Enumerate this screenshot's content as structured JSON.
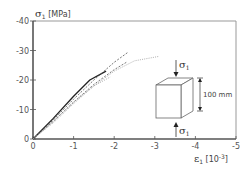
{
  "chart_data": {
    "type": "line",
    "title": "",
    "xlabel": "ε1 [10-3]",
    "ylabel": "σ1 [MPa]",
    "xlim": [
      0,
      -5
    ],
    "ylim": [
      0,
      -40
    ],
    "grid": false,
    "x_ticks": [
      "0",
      "-1",
      "-2",
      "-3",
      "-4",
      "-5"
    ],
    "y_ticks": [
      "0",
      "-10",
      "-20",
      "-30",
      "-40"
    ],
    "series": [
      {
        "name": "solid",
        "style": "solid",
        "x": [
          0,
          -0.5,
          -1.0,
          -1.4,
          -1.8
        ],
        "y": [
          0,
          -7,
          -14.5,
          -20,
          -23
        ]
      },
      {
        "name": "dashed-1",
        "style": "dashed",
        "x": [
          0,
          -0.5,
          -1.0,
          -1.5,
          -2.0,
          -2.35
        ],
        "y": [
          0,
          -6.5,
          -13.5,
          -20,
          -26,
          -29.5
        ]
      },
      {
        "name": "dashed-2",
        "style": "dashed",
        "x": [
          0,
          -0.5,
          -1.0,
          -1.5,
          -2.0,
          -2.3
        ],
        "y": [
          0,
          -6,
          -12.5,
          -18.5,
          -23.5,
          -26
        ]
      },
      {
        "name": "dotted-light",
        "style": "dotted",
        "x": [
          0,
          -0.5,
          -1.0,
          -1.5,
          -2.0,
          -2.5,
          -3.1
        ],
        "y": [
          0,
          -5.5,
          -12,
          -18,
          -23,
          -26.5,
          -28
        ]
      },
      {
        "name": "dotted-2",
        "style": "dotted",
        "x": [
          0,
          -0.5,
          -1.0,
          -1.5,
          -1.9
        ],
        "y": [
          0,
          -6,
          -12.5,
          -18,
          -21
        ]
      }
    ],
    "annotations": [
      {
        "text": "σ1",
        "position": "top arrow"
      },
      {
        "text": "σ1",
        "position": "bottom arrow"
      },
      {
        "text": "100 mm",
        "position": "cube dimension"
      }
    ]
  },
  "labels": {
    "y_title_sigma": "σ",
    "y_title_sub": "1",
    "y_title_unit": " [MPa]",
    "x_title_eps": "ε",
    "x_title_sub": "1",
    "x_title_unit": " [10",
    "x_title_exp": "-3",
    "x_title_close": "]",
    "sigma_top": "σ",
    "sigma_top_sub": "1",
    "sigma_bottom": "σ",
    "sigma_bottom_sub": "1",
    "dimension": "100 mm"
  }
}
